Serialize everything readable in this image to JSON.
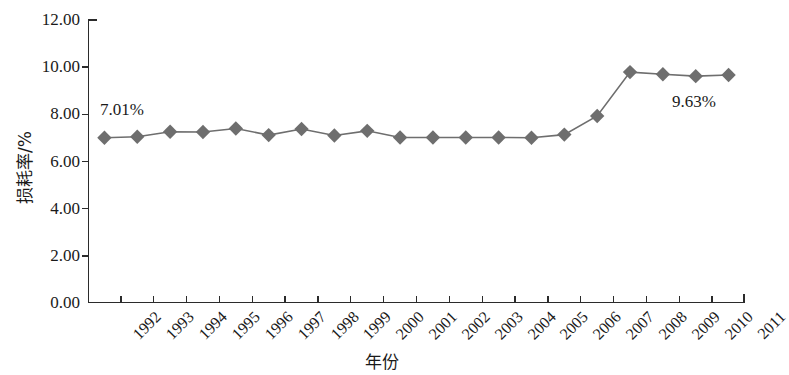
{
  "chart_data": {
    "type": "line",
    "title": "",
    "xlabel": "年份",
    "ylabel": "损耗率/%",
    "grid": false,
    "legend": "none",
    "ylim": [
      0,
      12
    ],
    "ytick_labels": [
      "12.00",
      "10.00",
      "8.00",
      "6.00",
      "4.00",
      "2.00",
      "0.00"
    ],
    "ytick_values": [
      12,
      10,
      8,
      6,
      4,
      2,
      0
    ],
    "categories": [
      "1992",
      "1993",
      "1994",
      "1995",
      "1996",
      "1997",
      "1998",
      "1999",
      "2000",
      "2001",
      "2002",
      "2003",
      "2004",
      "2005",
      "2006",
      "2007",
      "2008",
      "2009",
      "2010",
      "2011"
    ],
    "values": [
      7.01,
      7.05,
      7.26,
      7.25,
      7.4,
      7.12,
      7.38,
      7.1,
      7.3,
      7.02,
      7.02,
      7.02,
      7.02,
      7.01,
      7.14,
      7.93,
      9.79,
      9.7,
      9.62,
      9.67
    ],
    "series": [
      {
        "name": "损耗率",
        "color": "#6e6e6e",
        "marker": "diamond",
        "values": [
          7.01,
          7.05,
          7.26,
          7.25,
          7.4,
          7.12,
          7.38,
          7.1,
          7.3,
          7.02,
          7.02,
          7.02,
          7.02,
          7.01,
          7.14,
          7.93,
          9.79,
          9.7,
          9.62,
          9.67
        ]
      }
    ],
    "annotations": [
      {
        "id": "first",
        "text": "7.01%",
        "category": "1992",
        "value": 7.01
      },
      {
        "id": "last",
        "text": "9.63%",
        "category": "2011",
        "value": 9.67
      }
    ],
    "colors": {
      "line": "#6e6e6e",
      "marker": "#6e6e6e",
      "axis": "#2b2b2b",
      "text": "#1a1a1a",
      "background": "#ffffff"
    }
  }
}
